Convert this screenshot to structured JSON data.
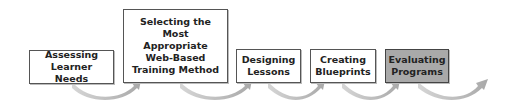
{
  "diagram": {
    "type": "process-flow",
    "steps": [
      {
        "label": "Assessing Learner Needs",
        "highlighted": false
      },
      {
        "label": "Selecting the Most Appropriate Web-Based Training Method",
        "highlighted": false
      },
      {
        "label": "Designing Lessons",
        "highlighted": false
      },
      {
        "label": "Creating Blueprints",
        "highlighted": false
      },
      {
        "label": "Evaluating Programs",
        "highlighted": true
      }
    ],
    "colors": {
      "arrow": "#b5b5b5",
      "highlight_fill": "#a9a9a9",
      "border": "#555555"
    }
  }
}
